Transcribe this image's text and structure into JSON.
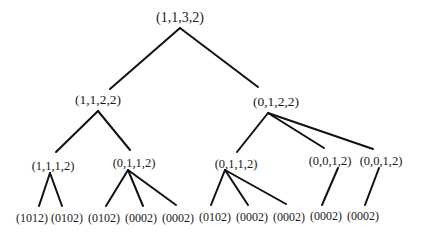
{
  "diagram": {
    "type": "tree",
    "edge_color": "#111111",
    "nodes": [
      {
        "id": "n0",
        "label": "(1,1,3,2)",
        "level": 0,
        "x": 180,
        "y": 18
      },
      {
        "id": "n1",
        "label": "(1,1,2,2)",
        "level": 1,
        "x": 98,
        "y": 100
      },
      {
        "id": "n2",
        "label": "(0,1,2,2)",
        "level": 1,
        "x": 276,
        "y": 102
      },
      {
        "id": "n3",
        "label": "(1,1,1,2)",
        "level": 2,
        "x": 53,
        "y": 166
      },
      {
        "id": "n4",
        "label": "(0,1,1,2)",
        "level": 2,
        "x": 134,
        "y": 163
      },
      {
        "id": "n5",
        "label": "(0,1,1,2)",
        "level": 2,
        "x": 236,
        "y": 164
      },
      {
        "id": "n6",
        "label": "(0,0,1,2)",
        "level": 2,
        "x": 330,
        "y": 161
      },
      {
        "id": "n7",
        "label": "(0,0,1,2)",
        "level": 2,
        "x": 381,
        "y": 161
      },
      {
        "id": "n8",
        "label": "(1012)",
        "level": 3,
        "x": 32,
        "y": 218
      },
      {
        "id": "n9",
        "label": "(0102)",
        "level": 3,
        "x": 67,
        "y": 218
      },
      {
        "id": "n10",
        "label": "(0102)",
        "level": 3,
        "x": 104,
        "y": 218
      },
      {
        "id": "n11",
        "label": "(0002)",
        "level": 3,
        "x": 141,
        "y": 218
      },
      {
        "id": "n12",
        "label": "(0002)",
        "level": 3,
        "x": 178,
        "y": 218
      },
      {
        "id": "n13",
        "label": "(0102)",
        "level": 3,
        "x": 215,
        "y": 217
      },
      {
        "id": "n14",
        "label": "(0002)",
        "level": 3,
        "x": 252,
        "y": 217
      },
      {
        "id": "n15",
        "label": "(0002)",
        "level": 3,
        "x": 289,
        "y": 217
      },
      {
        "id": "n16",
        "label": "(0002)",
        "level": 3,
        "x": 326,
        "y": 216
      },
      {
        "id": "n17",
        "label": "(0002)",
        "level": 3,
        "x": 363,
        "y": 216
      }
    ],
    "edges": [
      {
        "from": "n0",
        "to": "n1",
        "x1": 180,
        "y1": 28,
        "x2": 110,
        "y2": 89
      },
      {
        "from": "n0",
        "to": "n2",
        "x1": 180,
        "y1": 28,
        "x2": 258,
        "y2": 87
      },
      {
        "from": "n1",
        "to": "n3",
        "x1": 98,
        "y1": 111,
        "x2": 56,
        "y2": 152
      },
      {
        "from": "n1",
        "to": "n4",
        "x1": 98,
        "y1": 111,
        "x2": 130,
        "y2": 150
      },
      {
        "from": "n2",
        "to": "n5",
        "x1": 268,
        "y1": 113,
        "x2": 237,
        "y2": 152
      },
      {
        "from": "n2",
        "to": "n6",
        "x1": 268,
        "y1": 113,
        "x2": 324,
        "y2": 148
      },
      {
        "from": "n2",
        "to": "n7",
        "x1": 268,
        "y1": 113,
        "x2": 373,
        "y2": 149
      },
      {
        "from": "n3",
        "to": "n8",
        "x1": 50,
        "y1": 173,
        "x2": 39,
        "y2": 206
      },
      {
        "from": "n3",
        "to": "n9",
        "x1": 50,
        "y1": 173,
        "x2": 62,
        "y2": 206
      },
      {
        "from": "n4",
        "to": "n10",
        "x1": 128,
        "y1": 170,
        "x2": 106,
        "y2": 206
      },
      {
        "from": "n4",
        "to": "n11",
        "x1": 128,
        "y1": 170,
        "x2": 143,
        "y2": 206
      },
      {
        "from": "n4",
        "to": "n12",
        "x1": 128,
        "y1": 170,
        "x2": 176,
        "y2": 205
      },
      {
        "from": "n5",
        "to": "n13",
        "x1": 225,
        "y1": 170,
        "x2": 211,
        "y2": 205
      },
      {
        "from": "n5",
        "to": "n14",
        "x1": 225,
        "y1": 170,
        "x2": 248,
        "y2": 205
      },
      {
        "from": "n5",
        "to": "n15",
        "x1": 225,
        "y1": 170,
        "x2": 286,
        "y2": 204
      },
      {
        "from": "n6",
        "to": "n16",
        "x1": 338,
        "y1": 168,
        "x2": 322,
        "y2": 205
      },
      {
        "from": "n7",
        "to": "n17",
        "x1": 379,
        "y1": 168,
        "x2": 365,
        "y2": 205
      }
    ]
  }
}
